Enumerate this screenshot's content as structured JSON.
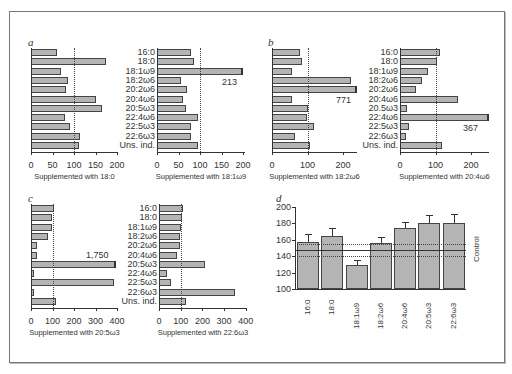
{
  "figure": {
    "row_labels": [
      "16:0",
      "18:0",
      "18:1ω9",
      "18:2ω6",
      "20:2ω6",
      "20:4ω6",
      "20:5ω3",
      "22:4ω6",
      "22:5ω3",
      "22:6ω3",
      "Uns. ind."
    ],
    "row_labels_b": [
      "16:0",
      "18:0",
      "18:1ω9",
      "18:2ω6",
      "20:2ω6",
      "20:4ω6",
      "20.5ω3",
      "22:4ω6",
      "22:5ω3",
      "22:6ω3",
      "Uns. ind."
    ],
    "panel_labels": {
      "a": "a",
      "b": "b",
      "c": "c",
      "d": "d"
    }
  },
  "chart_data": [
    {
      "panel": "a-left",
      "type": "bar",
      "orientation": "horizontal",
      "title": "",
      "xlabel": "Supplemented with 18:0",
      "categories": [
        "16:0",
        "18:0",
        "18:1ω9",
        "18:2ω6",
        "20:2ω6",
        "20:4ω6",
        "20:5ω3",
        "22:4ω6",
        "22:5ω3",
        "22:6ω3",
        "Uns. ind."
      ],
      "values": [
        60,
        175,
        70,
        85,
        82,
        152,
        165,
        80,
        90,
        115,
        112
      ],
      "xlim": [
        0,
        200
      ],
      "xticks": [
        0,
        50,
        100,
        150,
        200
      ],
      "reference_line": 100
    },
    {
      "panel": "a-right",
      "type": "bar",
      "orientation": "horizontal",
      "xlabel": "Supplemented with 18:1ω9",
      "categories": [
        "16:0",
        "18:0",
        "18:1ω9",
        "18:2ω6",
        "20:2ω6",
        "20:4ω6",
        "20:5ω3",
        "22:4ω6",
        "22:5ω3",
        "22:6ω3",
        "Uns. ind."
      ],
      "values": [
        78,
        85,
        213,
        55,
        70,
        60,
        68,
        95,
        80,
        80,
        95
      ],
      "xlim": [
        0,
        200
      ],
      "xticks": [
        0,
        50,
        100,
        150,
        200
      ],
      "reference_line": 100,
      "annotations": [
        {
          "category": "18:1ω9",
          "text": "213",
          "broken_axis": true
        }
      ]
    },
    {
      "panel": "b-left",
      "type": "bar",
      "orientation": "horizontal",
      "xlabel": "Supplemented with 18:2ω6",
      "categories": [
        "16:0",
        "18:0",
        "18:1ω9",
        "18:2ω6",
        "20:2ω6",
        "20:4ω6",
        "20.5ω3",
        "22:4ω6",
        "22:5ω3",
        "22:6ω3",
        "Uns. ind."
      ],
      "values": [
        78,
        85,
        55,
        222,
        771,
        55,
        102,
        98,
        118,
        65,
        107
      ],
      "xlim": [
        0,
        250
      ],
      "xticks": [
        0,
        100,
        200
      ],
      "reference_line": 100,
      "annotations": [
        {
          "category": "20:2ω6",
          "text": "771",
          "broken_axis": true
        }
      ]
    },
    {
      "panel": "b-right",
      "type": "bar",
      "orientation": "horizontal",
      "xlabel": "Supplemented with 20:4ω6",
      "categories": [
        "16:0",
        "18:0",
        "18:1ω9",
        "18:2ω6",
        "20:2ω6",
        "20:4ω6",
        "20.5ω3",
        "22:4ω6",
        "22:5ω3",
        "22:6ω3",
        "Uns. ind."
      ],
      "values": [
        112,
        105,
        80,
        62,
        45,
        162,
        20,
        367,
        25,
        17,
        118
      ],
      "xlim": [
        0,
        250
      ],
      "xticks": [
        0,
        100,
        200
      ],
      "reference_line": 100,
      "annotations": [
        {
          "category": "22:4ω6",
          "text": "367",
          "broken_axis": true
        }
      ]
    },
    {
      "panel": "c-left",
      "type": "bar",
      "orientation": "horizontal",
      "xlabel": "Supplemented with 20:5ω3",
      "categories": [
        "16:0",
        "18:0",
        "18:1ω9",
        "18:2ω6",
        "20:2ω6",
        "20:4ω6",
        "20:5ω3",
        "22:4ω6",
        "22:5ω3",
        "22:6ω3",
        "Uns. ind."
      ],
      "values": [
        105,
        97,
        97,
        77,
        28,
        28,
        1750,
        15,
        388,
        12,
        115
      ],
      "xlim": [
        0,
        400
      ],
      "xticks": [
        0,
        100,
        200,
        300,
        400
      ],
      "reference_line": 100,
      "annotations": [
        {
          "category": "20:5ω3",
          "text": "1,750",
          "broken_axis": true
        }
      ]
    },
    {
      "panel": "c-right",
      "type": "bar",
      "orientation": "horizontal",
      "xlabel": "Supplemented with 22:6ω3",
      "categories": [
        "16:0",
        "18:0",
        "18:1ω9",
        "18:2ω6",
        "20:2ω6",
        "20:4ω6",
        "20:5ω3",
        "22:4ω6",
        "22:5ω3",
        "22:6ω3",
        "Uns. ind."
      ],
      "values": [
        112,
        108,
        100,
        95,
        95,
        82,
        210,
        35,
        53,
        352,
        125
      ],
      "xlim": [
        0,
        400
      ],
      "xticks": [
        0,
        100,
        200,
        300,
        400
      ],
      "reference_line": 100
    },
    {
      "panel": "d",
      "type": "bar",
      "orientation": "vertical",
      "xlabel": "",
      "ylabel": "",
      "categories": [
        "16:0",
        "18:0",
        "18:1ω9",
        "18:2ω6",
        "20:4ω6",
        "20:5ω3",
        "22:6ω3"
      ],
      "values": [
        157,
        165,
        129,
        156,
        174,
        180,
        181
      ],
      "error_upper": [
        167,
        175,
        135,
        163,
        182,
        190,
        191
      ],
      "ylim": [
        100,
        200
      ],
      "yticks": [
        100,
        120,
        140,
        160,
        180,
        200
      ],
      "control": {
        "label": "Control",
        "value": 148,
        "band": [
          140,
          155
        ]
      }
    }
  ]
}
